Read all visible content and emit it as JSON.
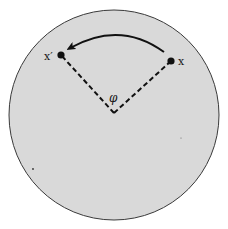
{
  "diagram": {
    "colors": {
      "background": "#ffffff",
      "disk_fill": "#d9d9d9",
      "disk_stroke": "#3a3a3a",
      "ink": "#111111"
    },
    "labels": {
      "point_x": "x",
      "point_x_prime": "x′",
      "angle": "φ"
    },
    "geometry": {
      "disk": {
        "cx": 114,
        "cy": 115,
        "r": 105
      },
      "vertex": {
        "x": 114,
        "y": 113
      },
      "point_x": {
        "x": 171,
        "y": 61
      },
      "point_x_prime": {
        "x": 61,
        "y": 55
      }
    }
  }
}
